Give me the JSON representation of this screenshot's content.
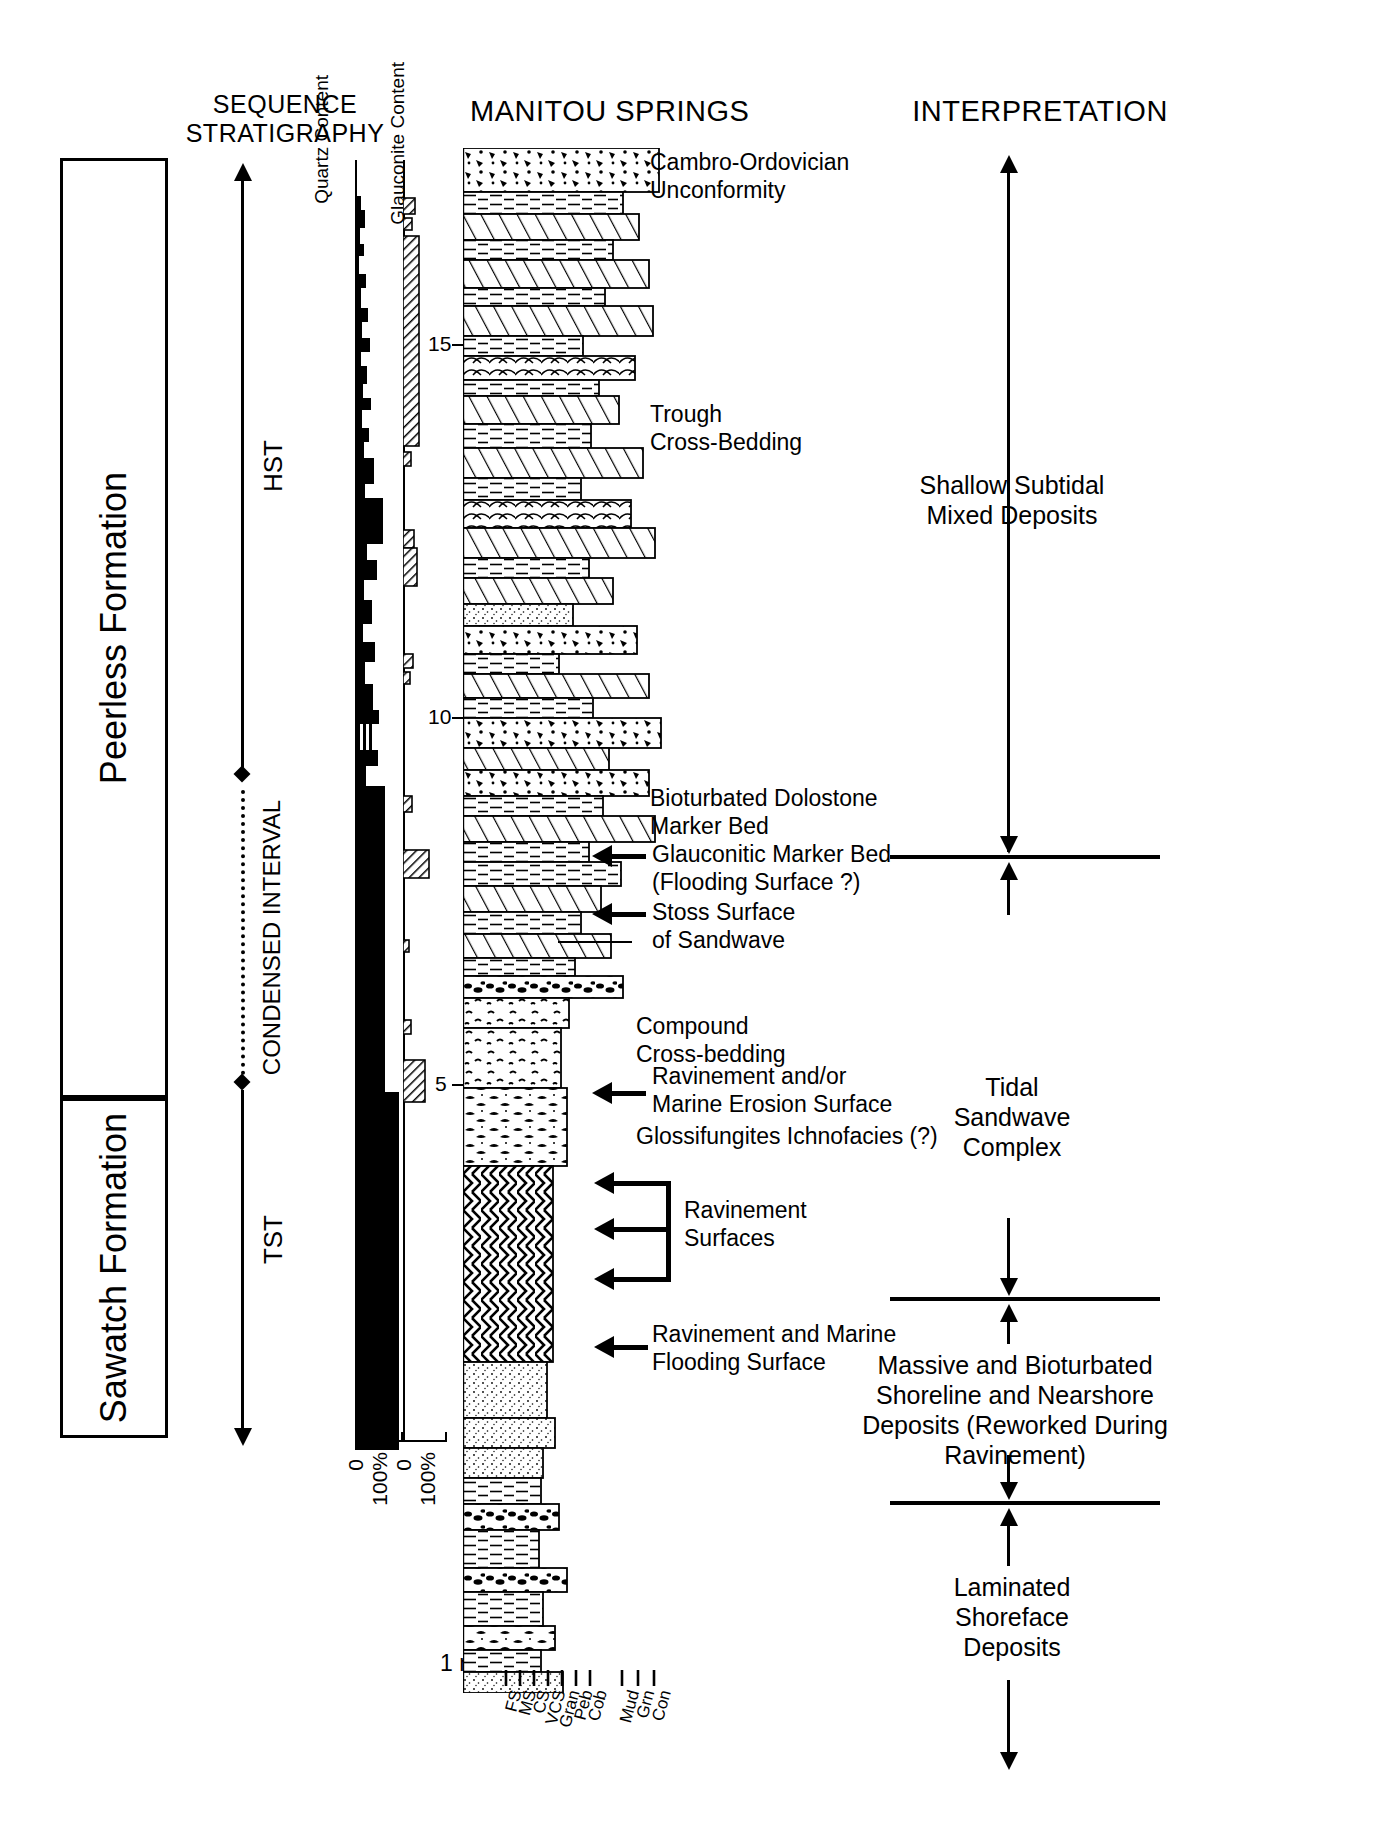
{
  "headers": {
    "sequence_stratigraphy": "SEQUENCE\nSTRATIGRAPHY",
    "quartz_content": "Quartz\nContent",
    "glauconite_content": "Glauconite\nContent",
    "manitou_springs": "MANITOU SPRINGS",
    "interpretation": "INTERPRETATION"
  },
  "formations": [
    {
      "name": "Peerless Formation"
    },
    {
      "name": "Sawatch Formation"
    }
  ],
  "systems_tracts": [
    {
      "label": "HST"
    },
    {
      "label": "CONDENSED INTERVAL"
    },
    {
      "label": "TST"
    }
  ],
  "quartz_axis": {
    "min": "0",
    "max": "100%"
  },
  "glauconite_axis": {
    "min": "0",
    "max": "100%"
  },
  "depth_ticks": [
    {
      "label": "15"
    },
    {
      "label": "10"
    },
    {
      "label": "5"
    }
  ],
  "scale_bar": {
    "label": "1 m"
  },
  "grain_size_labels": [
    "FS",
    "MS",
    "CS",
    "VCS",
    "Gran",
    "Peb",
    "Cob"
  ],
  "carbonate_labels": [
    "Mud",
    "Grn",
    "Con"
  ],
  "annotations": [
    {
      "text": "Cambro-Ordovician\nUnconformity",
      "arrow": "none"
    },
    {
      "text": "Trough\nCross-Bedding",
      "arrow": "none"
    },
    {
      "text": "Bioturbated Dolostone\nMarker Bed",
      "arrow": "none"
    },
    {
      "text": "Glauconitic Marker Bed\n(Flooding Surface ?)",
      "arrow": "left"
    },
    {
      "text": "Stoss Surface\nof Sandwave",
      "arrow": "left"
    },
    {
      "text": "Compound\nCross-bedding",
      "arrow": "none"
    },
    {
      "text": "Ravinement and/or\nMarine Erosion Surface",
      "arrow": "left"
    },
    {
      "text": "Glossifungites Ichnofacies (?)",
      "arrow": "none"
    },
    {
      "text": "Ravinement\nSurfaces",
      "arrow": "bracket-left"
    },
    {
      "text": "Ravinement and Marine\nFlooding Surface",
      "arrow": "left"
    }
  ],
  "interpretations": [
    {
      "text": "Shallow Subtidal\nMixed Deposits"
    },
    {
      "text": "Tidal\nSandwave\nComplex"
    },
    {
      "text": "Massive and Bioturbated\nShoreline and Nearshore\nDeposits (Reworked During\nRavinement)"
    },
    {
      "text": "Laminated\nShoreface\nDeposits"
    }
  ],
  "colors": {
    "ink": "#000000",
    "paper": "#ffffff"
  }
}
